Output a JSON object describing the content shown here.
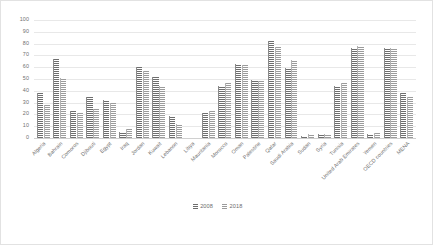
{
  "chart_data": {
    "type": "bar",
    "title": "",
    "subtitle": "",
    "xlabel": "",
    "ylabel": "",
    "ylim": [
      0,
      100
    ],
    "y_ticks": [
      0,
      10,
      20,
      30,
      40,
      50,
      60,
      70,
      80,
      90,
      100
    ],
    "grid": true,
    "legend_position": "bottom",
    "categories": [
      "Algeria",
      "Bahrain",
      "Comoros",
      "Djibouti",
      "Egypt",
      "Iraq",
      "Jordan",
      "Kuwait",
      "Lebanon",
      "Libya",
      "Mauritania",
      "Morocco",
      "Oman",
      "Palestine",
      "Qatar",
      "Saudi Arabia",
      "Sudan",
      "Syria",
      "Tunisia",
      "United Arab Emirates",
      "Yemen",
      "OECD countries",
      "MENA"
    ],
    "series": [
      {
        "name": "2008",
        "color": "#7a7a7a",
        "values": [
          38,
          67,
          23,
          35,
          32,
          5,
          60,
          52,
          19,
          0,
          21,
          44,
          63,
          49,
          82,
          59,
          2,
          3,
          44,
          76,
          3,
          76,
          38
        ]
      },
      {
        "name": "2018",
        "color": "#a6a6a6",
        "values": [
          28,
          51,
          21,
          25,
          30,
          8,
          57,
          44,
          12,
          0,
          23,
          47,
          62,
          48,
          77,
          66,
          3,
          3,
          47,
          78,
          4,
          76,
          35
        ]
      }
    ]
  },
  "legend": {
    "items": [
      {
        "label": "2008"
      },
      {
        "label": "2018"
      }
    ]
  }
}
